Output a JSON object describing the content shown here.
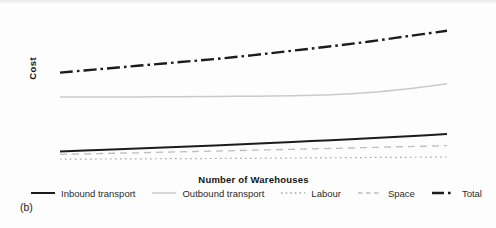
{
  "figure": {
    "panel_label": "(b)",
    "background_color": "#fdfdfd"
  },
  "chart_data": {
    "type": "line",
    "title": "",
    "xlabel": "Number of Warehouses",
    "ylabel": "Cost",
    "x_tick_labels": [],
    "y_tick_labels": [],
    "grid": "off",
    "legend_position": "bottom",
    "ylim": [
      0,
      150
    ],
    "series": [
      {
        "id": "inbound",
        "name": "Inbound transport",
        "color": "#1c1c1c",
        "style": "solid",
        "width": 2,
        "values": [
          17,
          18.5,
          20,
          21.5,
          23.2,
          25,
          26.8,
          28.6,
          30.6,
          32.6,
          34.8
        ]
      },
      {
        "id": "outbound",
        "name": "Outbound transport",
        "color": "#cacaca",
        "style": "solid",
        "width": 1.5,
        "values": [
          73,
          73,
          73,
          73.2,
          73.5,
          73.8,
          74.2,
          75.2,
          77.5,
          81.5,
          86.5
        ]
      },
      {
        "id": "labour",
        "name": "Labour",
        "color": "#a8a8a8",
        "style": "dotted",
        "width": 1.2,
        "values": [
          9,
          9.2,
          9.4,
          9.6,
          9.8,
          10,
          10.3,
          10.5,
          10.8,
          11,
          11.3
        ]
      },
      {
        "id": "space",
        "name": "Space",
        "color": "#bdbdbd",
        "style": "dashed",
        "width": 1.3,
        "values": [
          14,
          14.8,
          15.6,
          16.5,
          17.4,
          18.3,
          19.2,
          20.1,
          21.1,
          22,
          23
        ]
      },
      {
        "id": "total",
        "name": "Total",
        "color": "#1c1c1c",
        "style": "dashdot",
        "width": 2.4,
        "values": [
          98,
          101.5,
          105,
          108.5,
          112,
          116,
          120.5,
          125,
          130,
          135.5,
          141
        ]
      }
    ]
  }
}
